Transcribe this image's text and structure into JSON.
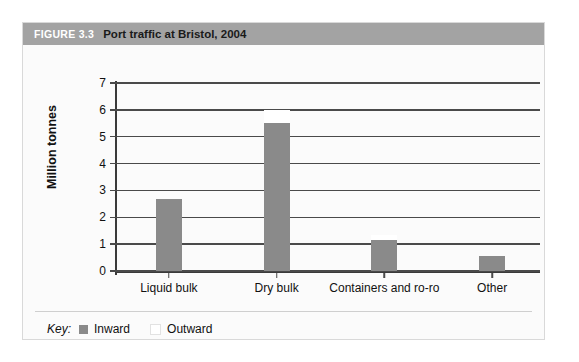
{
  "figure": {
    "number_label": "FIGURE 3.3",
    "title": "Port traffic at Bristol, 2004",
    "titlebar_color": "#a3a3a3",
    "background_color": "#fbfbfb"
  },
  "legend": {
    "title": "Key:",
    "items": [
      {
        "label": "Inward",
        "color": "#8a8a8a"
      },
      {
        "label": "Outward",
        "color": "#ffffff"
      }
    ]
  },
  "chart_data": {
    "type": "bar",
    "title": "Port traffic at Bristol, 2004",
    "subtitle": "",
    "xlabel": "",
    "ylabel": "Million tonnes",
    "categories": [
      "Liquid bulk",
      "Dry bulk",
      "Containers and ro-ro",
      "Other"
    ],
    "series": [
      {
        "name": "Inward",
        "color": "#8a8a8a",
        "values": [
          2.7,
          5.5,
          1.15,
          0.55
        ]
      },
      {
        "name": "Outward",
        "color": "#ffffff",
        "values": [
          0.0,
          0.5,
          0.2,
          0.0
        ]
      }
    ],
    "stacked": true,
    "ylim": [
      0,
      7
    ],
    "yticks": [
      0,
      1,
      2,
      3,
      4,
      5,
      6,
      7
    ],
    "ytick_labels": [
      "0",
      "1",
      "2",
      "3",
      "4",
      "5",
      "6",
      "7"
    ],
    "grid": true,
    "grid_axis": "y",
    "legend_position": "bottom-left"
  }
}
